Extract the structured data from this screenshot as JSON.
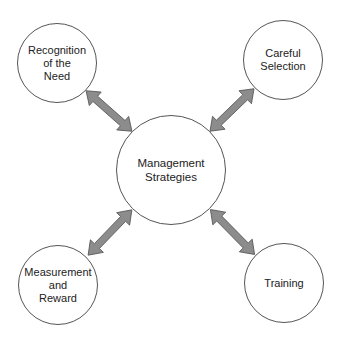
{
  "diagram": {
    "type": "hub-and-spoke",
    "center": {
      "label": "Management\nStrategies"
    },
    "nodes": [
      {
        "id": "recognition",
        "label": "Recognition\nof the\nNeed",
        "position": "top-left"
      },
      {
        "id": "selection",
        "label": "Careful\nSelection",
        "position": "top-right"
      },
      {
        "id": "measurement",
        "label": "Measurement\nand\nReward",
        "position": "bottom-left"
      },
      {
        "id": "training",
        "label": "Training",
        "position": "bottom-right"
      }
    ],
    "edges": [
      {
        "from": "center",
        "to": "recognition",
        "style": "double-arrow"
      },
      {
        "from": "center",
        "to": "selection",
        "style": "double-arrow"
      },
      {
        "from": "center",
        "to": "measurement",
        "style": "double-arrow"
      },
      {
        "from": "center",
        "to": "training",
        "style": "double-arrow"
      }
    ],
    "colors": {
      "arrow_fill": "#8c8c8c",
      "arrow_stroke": "#555555",
      "circle_stroke": "#555555",
      "text": "#222222",
      "background": "#ffffff"
    }
  }
}
